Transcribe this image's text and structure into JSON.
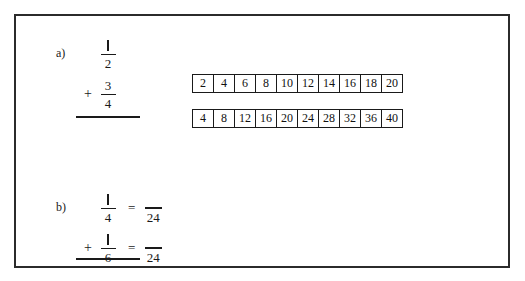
{
  "worksheet": {
    "title": "Fraction addition with common multiples",
    "border_color": "#2b2b2b",
    "background": "#ffffff"
  },
  "problems": [
    {
      "id": "a",
      "label": "a)",
      "expression": {
        "first_fraction": {
          "numerator": "1",
          "denominator": "2"
        },
        "operator": "+",
        "second_fraction": {
          "numerator": "3",
          "denominator": "4"
        },
        "has_equals": false,
        "sum_rule": true
      },
      "strips": [
        {
          "name": "multiples-of-2",
          "values": [
            "2",
            "4",
            "6",
            "8",
            "10",
            "12",
            "14",
            "16",
            "18",
            "20"
          ],
          "highlight_index": -1
        },
        {
          "name": "multiples-of-4",
          "values": [
            "4",
            "8",
            "12",
            "16",
            "20",
            "24",
            "28",
            "32",
            "36",
            "40"
          ],
          "highlight_index": -1
        }
      ]
    },
    {
      "id": "b",
      "label": "b)",
      "expression": {
        "first_fraction": {
          "numerator": "1",
          "denominator": "4"
        },
        "operator": "+",
        "second_fraction": {
          "numerator": "1",
          "denominator": "6"
        },
        "has_equals": true,
        "equals_sign": "=",
        "first_answer": {
          "numerator": "",
          "denominator": "24"
        },
        "second_answer": {
          "numerator": "",
          "denominator": "24"
        },
        "sum_rule": true
      },
      "strips": [
        {
          "name": "multiples-of-4",
          "values": [
            "4",
            "8",
            "12",
            "16",
            "20",
            "24",
            "28",
            "32",
            "36",
            "40"
          ],
          "highlight_index": 0
        },
        {
          "name": "multiples-of-6",
          "values": [
            "6",
            "12",
            "18",
            "24",
            "30",
            "36",
            "42",
            "48",
            "54",
            "60"
          ],
          "highlight_index": 0
        }
      ]
    }
  ]
}
